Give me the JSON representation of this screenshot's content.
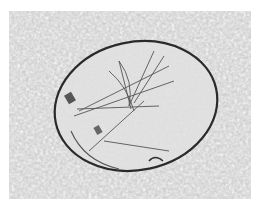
{
  "image": {
    "description": "Grayscale light micrograph of an oval cell/cyst with a dark outline containing a radiating bundle of needle-like crystals on a granular background",
    "colors": {
      "background": "#cfcfcf",
      "cell_fill": "#dedede",
      "outline": "#2a2a2a",
      "crystals": "#555555",
      "border": "#ffffff"
    }
  }
}
